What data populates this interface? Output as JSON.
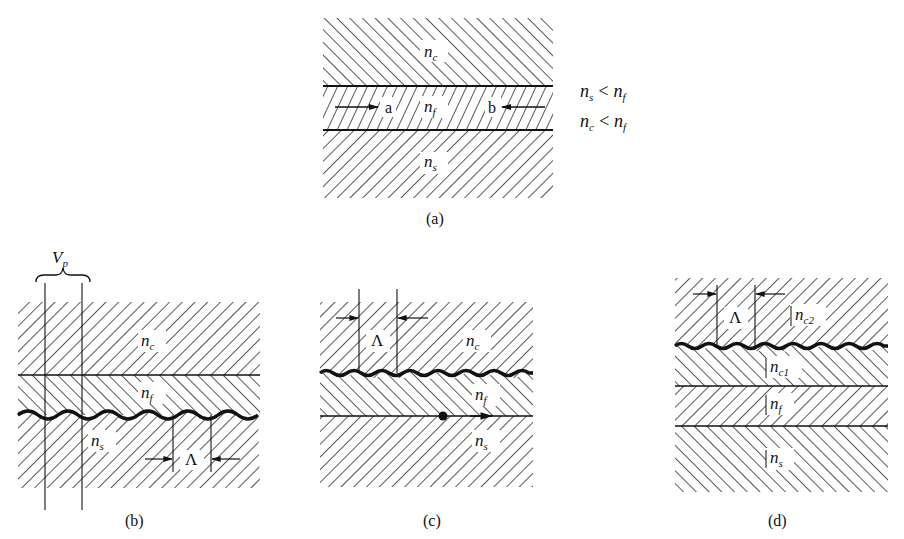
{
  "figure": {
    "panel_a": {
      "caption": "(a)",
      "layers": {
        "cover": "n",
        "cover_sub": "c",
        "film": "n",
        "film_sub": "f",
        "substrate": "n",
        "substrate_sub": "s"
      },
      "ray_labels": [
        "a",
        "b"
      ],
      "conditions": [
        {
          "lhs": "n",
          "lhs_sub": "s",
          "op": "<",
          "rhs": "n",
          "rhs_sub": "f"
        },
        {
          "lhs": "n",
          "lhs_sub": "c",
          "op": "<",
          "rhs": "n",
          "rhs_sub": "f"
        }
      ]
    },
    "panel_b": {
      "caption": "(b)",
      "bracket_label": "V",
      "bracket_sub": "p",
      "layers": {
        "cover": "n",
        "cover_sub": "c",
        "film": "n",
        "film_sub": "f",
        "substrate": "n",
        "substrate_sub": "s"
      },
      "period_label": "Λ"
    },
    "panel_c": {
      "caption": "(c)",
      "layers": {
        "cover": "n",
        "cover_sub": "c",
        "film": "n",
        "film_sub": "f",
        "substrate": "n",
        "substrate_sub": "s"
      },
      "period_label": "Λ"
    },
    "panel_d": {
      "caption": "(d)",
      "layers": {
        "cover2": "n",
        "cover2_sub": "c2",
        "cover1": "n",
        "cover1_sub": "c1",
        "film": "n",
        "film_sub": "f",
        "substrate": "n",
        "substrate_sub": "s"
      },
      "period_label": "Λ"
    }
  }
}
